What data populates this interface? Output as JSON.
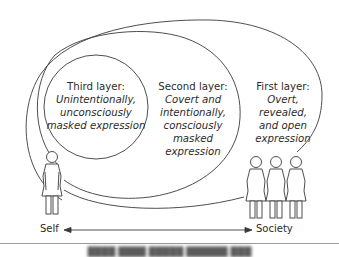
{
  "diagram": {
    "layers": [
      {
        "id": "third",
        "title": "Third layer:",
        "description_lines": [
          "Unintentionally,",
          "unconsciously",
          "masked expression"
        ]
      },
      {
        "id": "second",
        "title": "Second layer:",
        "description_lines": [
          "Covert and",
          "intentionally,",
          "consciously",
          "masked expression"
        ]
      },
      {
        "id": "first",
        "title": "First layer:",
        "description_lines": [
          "Overt,",
          "revealed,",
          "and open",
          "expression"
        ]
      }
    ],
    "axis": {
      "left_label": "Self",
      "right_label": "Society"
    },
    "figures": {
      "self_count": 1,
      "society_count": 3
    },
    "caption": "████ ████ █████ ██████ ███",
    "colors": {
      "stroke": "#3a3a3a",
      "text": "#2b2b2b",
      "rule": "#9a9a9a"
    }
  }
}
